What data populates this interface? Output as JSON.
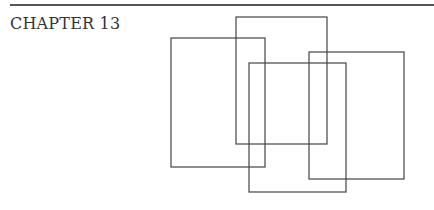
{
  "page": {
    "chapter_heading": "CHAPTER 13"
  },
  "figure": {
    "rectangles": [
      {
        "id": "rect-1"
      },
      {
        "id": "rect-2"
      },
      {
        "id": "rect-3"
      },
      {
        "id": "rect-4"
      }
    ],
    "stroke_color": "#444444"
  }
}
